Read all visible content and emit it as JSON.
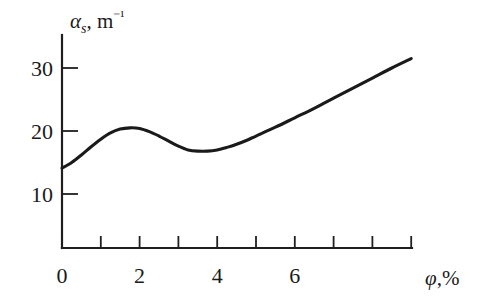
{
  "chart_data": {
    "type": "line",
    "title": "",
    "subtitle": "",
    "xlabel": "φ,%",
    "ylabel": "αs, m⁻¹",
    "ylabel_parts": {
      "symbol": "α",
      "subscript": "s",
      "separator": ", ",
      "unit": "m",
      "unit_exponent": "⁻¹"
    },
    "xlabel_parts": {
      "symbol": "φ",
      "separator": ",",
      "unit": "%"
    },
    "xlim": [
      0,
      9
    ],
    "ylim": [
      0,
      33.6
    ],
    "grid": false,
    "legend": null,
    "x_ticks_major": [
      0,
      2,
      4,
      6
    ],
    "x_tick_labels": [
      "0",
      "2",
      "4",
      "6"
    ],
    "x_ticks_minor": [
      1,
      3,
      5,
      7,
      8,
      9
    ],
    "y_ticks_major": [
      10,
      20,
      30
    ],
    "y_tick_labels": [
      "10",
      "20",
      "30"
    ],
    "line_color": "#1a1a1a",
    "axis_color": "#1f1f1f",
    "background_color": "#ffffff",
    "series": [
      {
        "name": "alpha_s",
        "x": [
          0.0,
          0.25,
          0.5,
          0.75,
          1.0,
          1.25,
          1.5,
          1.75,
          2.0,
          2.25,
          2.5,
          2.75,
          3.0,
          3.25,
          3.5,
          3.75,
          4.0,
          4.25,
          4.5,
          4.75,
          5.0,
          5.5,
          6.0,
          6.5,
          7.0,
          7.5,
          8.0,
          8.5,
          9.0
        ],
        "y": [
          14.1,
          15.0,
          16.2,
          17.5,
          18.7,
          19.7,
          20.3,
          20.5,
          20.4,
          19.9,
          19.2,
          18.4,
          17.6,
          17.0,
          16.8,
          16.8,
          17.0,
          17.4,
          17.9,
          18.5,
          19.2,
          20.6,
          22.1,
          23.6,
          25.2,
          26.8,
          28.4,
          30.0,
          31.5
        ]
      }
    ],
    "annotations": {
      "start_value": 14.1,
      "local_maximum": {
        "x": 1.75,
        "y": 20.5
      },
      "local_minimum": {
        "x": 3.4,
        "y": 16.8
      },
      "end_value": 31.5
    }
  }
}
